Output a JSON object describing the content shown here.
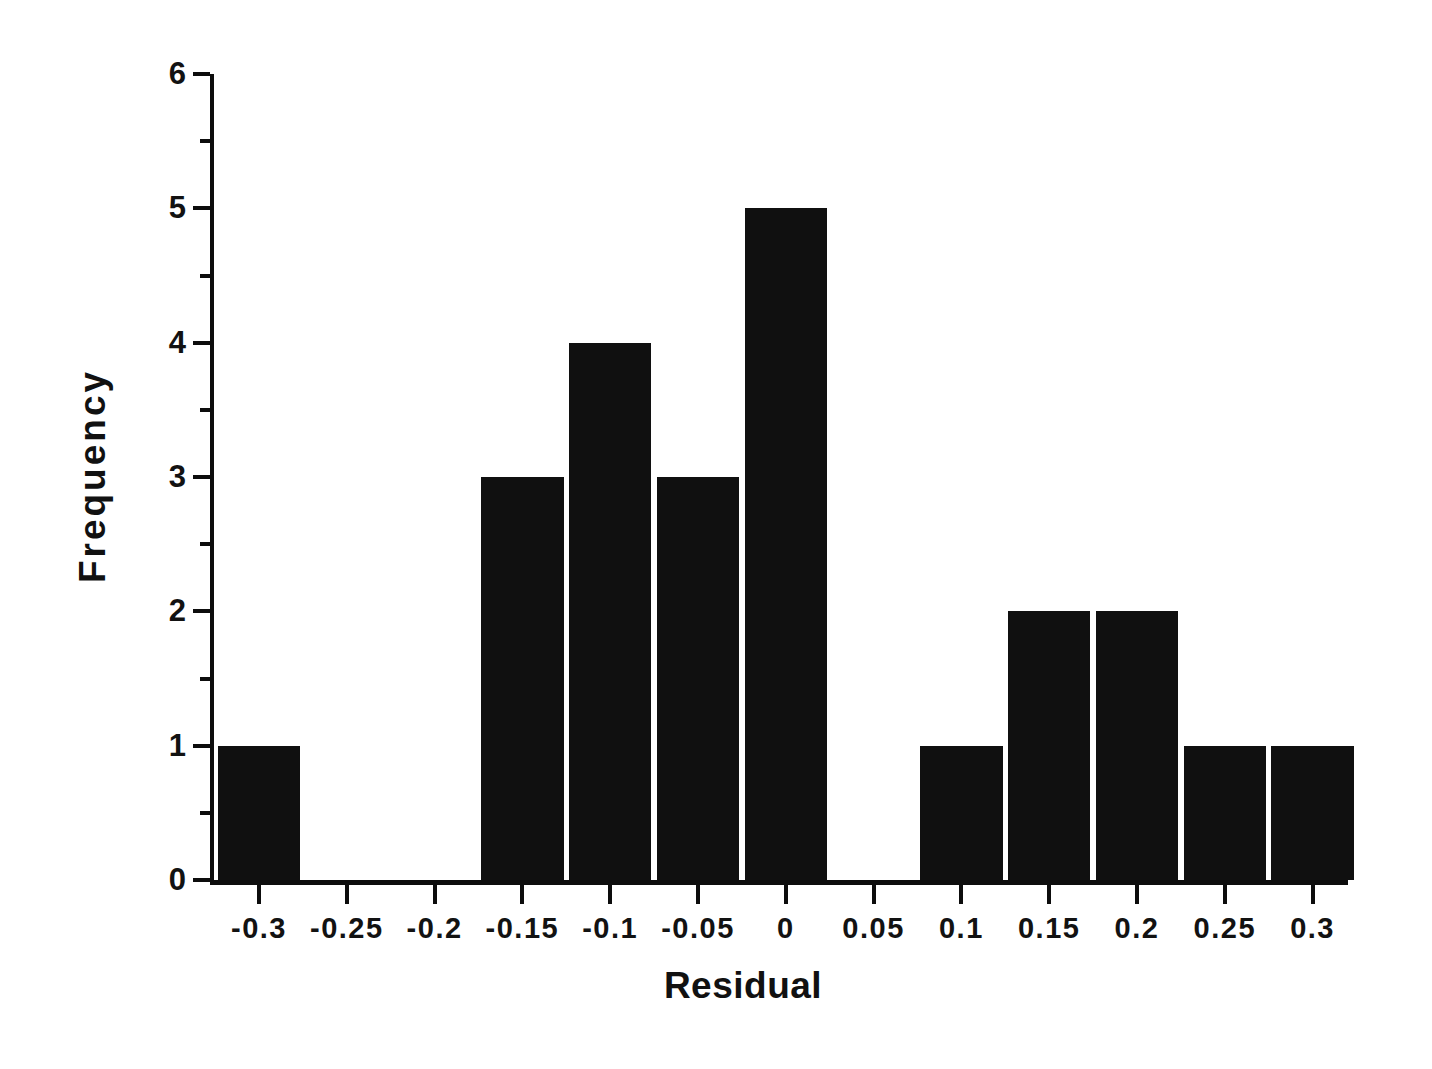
{
  "chart_data": {
    "type": "bar",
    "title": "",
    "subtitle": "",
    "xlabel": "Residual",
    "ylabel": "Frequency",
    "categories": [
      "-0.3",
      "-0.25",
      "-0.2",
      "-0.15",
      "-0.1",
      "-0.05",
      "0",
      "0.05",
      "0.1",
      "0.15",
      "0.2",
      "0.25",
      "0.3"
    ],
    "values": [
      1,
      0,
      0,
      3,
      4,
      3,
      5,
      0,
      1,
      2,
      2,
      1,
      1
    ],
    "x_tick_labels": [
      "-0.3",
      "-0.25",
      "-0.2",
      "-0.15",
      "-0.1",
      "-0.05",
      "0",
      "0.05",
      "0.1",
      "0.15",
      "0.2",
      "0.25",
      "0.3"
    ],
    "y_tick_labels": [
      "0",
      "1",
      "2",
      "3",
      "4",
      "5",
      "6"
    ],
    "y_major_ticks": [
      0,
      1,
      2,
      3,
      4,
      5,
      6
    ],
    "y_minor_ticks": [
      0.5,
      1.5,
      2.5,
      3.5,
      4.5,
      5.5
    ],
    "xlim": [
      -0.325,
      0.325
    ],
    "ylim": [
      0,
      6
    ],
    "grid": false,
    "legend": false,
    "legend_position": "none",
    "bar_color": "#101010",
    "axis_color": "#0d0d0d",
    "background_color": "#ffffff",
    "bar_width_fraction": 0.94
  },
  "axis_titles": {
    "x": "Residual",
    "y": "Frequency"
  }
}
